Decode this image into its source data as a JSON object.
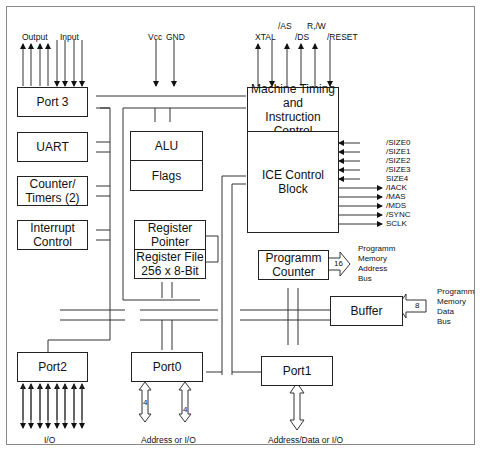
{
  "blocks": {
    "port3": "Port 3",
    "uart": "UART",
    "counter_timers": "Counter/\nTimers (2)",
    "interrupt_control": "Interrupt\nControl",
    "alu": "ALU",
    "flags": "Flags",
    "register_pointer": "Register\nPointer",
    "register_file": "Register File\n256 x 8-Bit",
    "machine_timing": "Machine Timing\nand\nInstruction Control",
    "ice_control": "ICE Control\nBlock",
    "program_counter": "Programm\nCounter",
    "buffer": "Buffer",
    "port2": "Port2",
    "port0": "Port0",
    "port1": "Port1"
  },
  "top_labels": {
    "output": "Output",
    "input": "Input",
    "vcc": "Vcc",
    "gnd": "GND",
    "xtal": "XTAL",
    "as": "/AS",
    "ds": "/DS",
    "rw": "R,/W",
    "reset": "/RESET"
  },
  "ice_signals": {
    "inputs": [
      "/SIZE0",
      "/SIZE1",
      "/SIZE2",
      "/SIZE3",
      "SIZE4"
    ],
    "outputs": [
      "/IACK",
      "/MAS",
      "/MDS",
      "/SYNC",
      "SCLK"
    ]
  },
  "buses": {
    "pm_address": {
      "width": "16",
      "label": "Programm\nMemory\nAddress\nBus"
    },
    "pm_data": {
      "width": "8",
      "label": "Programm\nMemory\nData\nBus"
    },
    "port0_a": "4",
    "port0_b": "4"
  },
  "bottom_labels": {
    "port2": "I/O",
    "port0": "Address or I/O",
    "port1": "Address/Data or I/O"
  }
}
